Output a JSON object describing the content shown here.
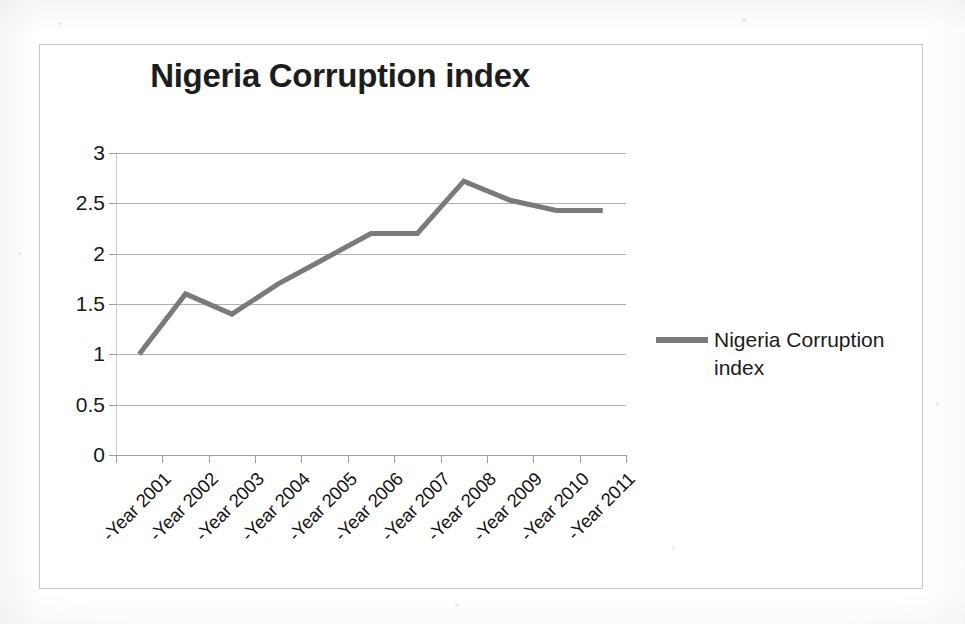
{
  "chart_data": {
    "type": "line",
    "title": "Nigeria Corruption index",
    "xlabel": "",
    "ylabel": "",
    "categories": [
      "-Year 2001",
      "-Year 2002",
      "-Year 2003",
      "-Year 2004",
      "-Year 2005",
      "-Year 2006",
      "-Year 2007",
      "-Year 2008",
      "-Year 2009",
      "-Year 2010",
      "-Year 2011"
    ],
    "series": [
      {
        "name": "Nigeria Corruption index",
        "color": "#7a7a7a",
        "values": [
          1.0,
          1.6,
          1.4,
          1.7,
          1.95,
          2.2,
          2.2,
          2.72,
          2.53,
          2.43,
          2.43
        ]
      }
    ],
    "ylim": [
      0,
      3
    ],
    "ytick_step": 0.5,
    "ytick_labels": [
      "3",
      "2.5",
      "2",
      "1.5",
      "1",
      "0.5",
      "0"
    ],
    "grid": true,
    "grid_axis": "y",
    "legend": {
      "position": "right",
      "entries": [
        "Nigeria Corruption index"
      ]
    },
    "x_tick_label_rotation": -45,
    "line_width": 5,
    "markers": false
  },
  "style": {
    "line_color": "#7a7a7a",
    "grid_color": "#b0b0b0",
    "border_color": "#c6c6c6",
    "text_color": "#171717",
    "background": "#ffffff"
  }
}
